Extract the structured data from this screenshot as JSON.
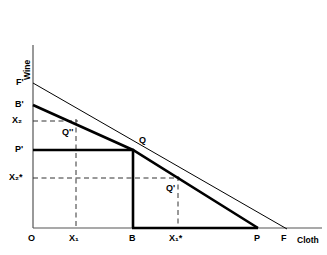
{
  "figure": {
    "type": "economics-production-possibility-diagram",
    "background": "#ffffff",
    "line_color": "#000000"
  },
  "axes": {
    "y_title": "Wine",
    "x_title": "Cloth",
    "origin_label": "O",
    "y_ticks": [
      {
        "label": "F",
        "sup": "'",
        "y": 83
      },
      {
        "label": "B",
        "sup": "'",
        "y": 105
      },
      {
        "label": "X",
        "sub": "2",
        "sup": "",
        "y": 121
      },
      {
        "label": "P",
        "sup": "'",
        "y": 150
      },
      {
        "label": "X",
        "sub": "2",
        "sup": "*",
        "y": 178
      }
    ],
    "x_ticks": [
      {
        "label": "O",
        "x": 33
      },
      {
        "label": "X",
        "sub": "1",
        "sup": "",
        "x": 76
      },
      {
        "label": "B",
        "x": 133
      },
      {
        "label": "X",
        "sub": "1",
        "sup": "*",
        "x": 178
      },
      {
        "label": "P",
        "x": 258
      },
      {
        "label": "F",
        "x": 285
      }
    ]
  },
  "labels": {
    "wine": "Wine",
    "cloth": "Cloth",
    "origin": "O",
    "F_prime": "F'",
    "B_prime": "B'",
    "X2": "X₂",
    "P_prime": "P'",
    "X2_star": "X₂*",
    "X1": "X₁",
    "B": "B",
    "X1_star": "X₁*",
    "P": "P",
    "F": "F",
    "Q": "Q",
    "Q_prime": "Q'",
    "Q_double_prime": "Q''"
  },
  "points": [
    {
      "name": "Q",
      "x": 133,
      "y": 150,
      "label": "Q"
    },
    {
      "name": "Q-double-prime",
      "x": 76,
      "y": 121,
      "label": "Q''"
    },
    {
      "name": "Q-prime",
      "x": 178,
      "y": 178,
      "label": "Q'"
    }
  ],
  "curves": {
    "price_line": {
      "name": "price-line-F-prime-to-F",
      "from": [
        33,
        83
      ],
      "to": [
        285,
        228
      ],
      "weight": "thin"
    },
    "ppf_upper": {
      "name": "ppf-segment-B-prime-to-Q",
      "from": [
        33,
        105
      ],
      "to": [
        133,
        150
      ],
      "weight": "bold"
    },
    "ppf_lower": {
      "name": "ppf-segment-Q-to-P",
      "from": [
        133,
        150
      ],
      "to": [
        258,
        228
      ],
      "weight": "bold"
    },
    "p_prime_line": {
      "name": "consumption-line-P-prime-to-Q",
      "from": [
        33,
        150
      ],
      "to": [
        133,
        150
      ],
      "weight": "bold"
    },
    "b_vertical": {
      "name": "vertical-line-at-B",
      "from": [
        133,
        150
      ],
      "to": [
        133,
        228
      ],
      "weight": "bold"
    },
    "base_segment": {
      "name": "base-segment-B-to-P",
      "from": [
        133,
        228
      ],
      "to": [
        258,
        228
      ],
      "weight": "bold"
    }
  },
  "dashed_lines": [
    {
      "name": "dashed-X2-horizontal",
      "from": [
        33,
        121
      ],
      "to": [
        76,
        121
      ]
    },
    {
      "name": "dashed-X1-vertical",
      "from": [
        76,
        121
      ],
      "to": [
        76,
        228
      ]
    },
    {
      "name": "dashed-X2-star-horizontal",
      "from": [
        33,
        178
      ],
      "to": [
        178,
        178
      ]
    },
    {
      "name": "dashed-X1-star-vertical",
      "from": [
        178,
        178
      ],
      "to": [
        178,
        228
      ]
    }
  ]
}
